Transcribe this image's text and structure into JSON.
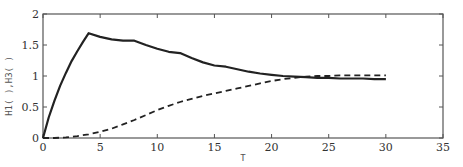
{
  "chart_data": {
    "type": "line",
    "title": "",
    "xlabel": "T",
    "ylabel": "H1(  ),H3(  )",
    "xlim": [
      0,
      35
    ],
    "ylim": [
      0,
      2
    ],
    "xticks": [
      0,
      5,
      10,
      15,
      20,
      25,
      30,
      35
    ],
    "yticks": [
      0,
      0.5,
      1,
      1.5,
      2
    ],
    "xtick_labels": [
      "0",
      "5",
      "10",
      "15",
      "20",
      "25",
      "30",
      "35"
    ],
    "ytick_labels": [
      "0",
      "0.5",
      "1",
      "1.5",
      "2"
    ],
    "grid": false,
    "legend": null,
    "series": [
      {
        "name": "H1",
        "style": "solid",
        "color": "#222222",
        "x": [
          0,
          0.5,
          1,
          1.5,
          2,
          2.5,
          3,
          3.5,
          4,
          5,
          6,
          7,
          8,
          9,
          10,
          11,
          12,
          13,
          14,
          15,
          16,
          17,
          18,
          19,
          20,
          21,
          22,
          23,
          24,
          25,
          26,
          27,
          28,
          29,
          30
        ],
        "values": [
          0,
          0.33,
          0.6,
          0.84,
          1.05,
          1.24,
          1.4,
          1.55,
          1.69,
          1.63,
          1.59,
          1.57,
          1.57,
          1.5,
          1.44,
          1.39,
          1.37,
          1.29,
          1.22,
          1.17,
          1.15,
          1.11,
          1.07,
          1.04,
          1.02,
          1.0,
          0.99,
          0.98,
          0.97,
          0.97,
          0.96,
          0.96,
          0.96,
          0.95,
          0.95
        ]
      },
      {
        "name": "H3",
        "style": "dashed",
        "color": "#222222",
        "x": [
          0,
          1,
          2,
          3,
          4,
          5,
          6,
          7,
          8,
          9,
          10,
          11,
          12,
          13,
          14,
          15,
          16,
          17,
          18,
          19,
          20,
          21,
          22,
          23,
          24,
          25,
          26,
          27,
          28,
          29,
          30
        ],
        "values": [
          0,
          0.0,
          0.01,
          0.03,
          0.06,
          0.1,
          0.15,
          0.22,
          0.29,
          0.37,
          0.45,
          0.52,
          0.58,
          0.63,
          0.68,
          0.72,
          0.76,
          0.8,
          0.84,
          0.88,
          0.92,
          0.95,
          0.97,
          0.99,
          1.0,
          1.0,
          1.01,
          1.01,
          1.01,
          1.01,
          1.01
        ]
      }
    ]
  },
  "layout": {
    "plot_left": 43,
    "plot_right": 443,
    "plot_top": 14,
    "plot_bottom": 138
  }
}
